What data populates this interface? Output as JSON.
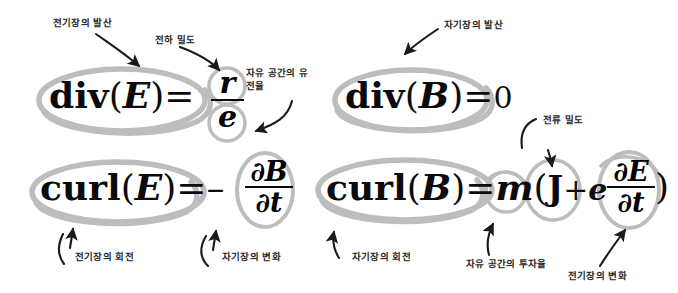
{
  "figure": {
    "background_color": "#ffffff",
    "text_color": "#0b0b0b",
    "highlight_color": "#b8b8b8",
    "annotation_color": "#262626"
  },
  "equations": [
    {
      "id": "gauss-electric",
      "lhs_operator": "div",
      "lhs_open_paren": "(",
      "lhs_field": "E",
      "lhs_close_paren": ")",
      "equals": "=",
      "rhs_numerator": "r",
      "rhs_denominator": "e"
    },
    {
      "id": "gauss-magnetic",
      "lhs_operator": "div",
      "lhs_open_paren": "(",
      "lhs_field": "B",
      "lhs_close_paren": ")",
      "equals": "=",
      "rhs_value": "0"
    },
    {
      "id": "faraday",
      "lhs_operator": "curl",
      "lhs_open_paren": "(",
      "lhs_field": "E",
      "lhs_close_paren": ")",
      "equals": "=",
      "sign": "–",
      "rhs_numerator": "∂B",
      "rhs_denominator": "∂t"
    },
    {
      "id": "ampere-maxwell",
      "lhs_operator": "curl",
      "lhs_open_paren": "(",
      "lhs_field": "B",
      "lhs_close_paren": ")",
      "equals": "=",
      "mu": "m",
      "open_paren": "(",
      "current": "J",
      "plus": "+",
      "epsilon": "e",
      "rhs_numerator": "∂E",
      "rhs_denominator": "∂t",
      "close_paren": ")"
    }
  ],
  "annotations": [
    {
      "id": "div-e-label",
      "text": "전기장의 발산"
    },
    {
      "id": "charge-density",
      "text": "전하 밀도"
    },
    {
      "id": "permittivity",
      "text": "자유 공간의 유전율"
    },
    {
      "id": "div-b-label",
      "text": "자기장의 발산"
    },
    {
      "id": "current-density",
      "text": "전류 밀도"
    },
    {
      "id": "curl-e-label",
      "text": "전기장의 회전"
    },
    {
      "id": "dbdt-label",
      "text": "자기장의 변화"
    },
    {
      "id": "curl-b-label",
      "text": "자기장의 회전"
    },
    {
      "id": "permeability",
      "text": "자유 공간의 투자율"
    },
    {
      "id": "dedt-label",
      "text": "전기장의 변화"
    }
  ]
}
